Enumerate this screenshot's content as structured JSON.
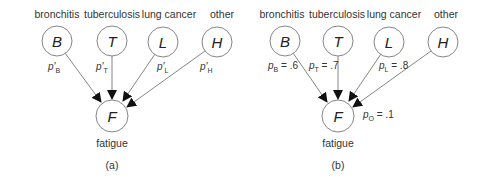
{
  "panels": [
    {
      "id": "a",
      "caption": "(a)",
      "nodes": [
        {
          "key": "B",
          "letter": "B",
          "label": "bronchitis",
          "cx": 57,
          "cy": 41
        },
        {
          "key": "T",
          "letter": "T",
          "label": "tuberculosis",
          "cx": 112,
          "cy": 41
        },
        {
          "key": "L",
          "letter": "L",
          "label": "lung cancer",
          "cx": 163,
          "cy": 42
        },
        {
          "key": "H",
          "letter": "H",
          "label": "other",
          "cx": 217,
          "cy": 42
        }
      ],
      "target": {
        "letter": "F",
        "label": "fatigue",
        "cx": 112,
        "cy": 116
      },
      "edge_labels": [
        {
          "sym": "p'",
          "sub": "B",
          "value": ""
        },
        {
          "sym": "p'",
          "sub": "T",
          "value": ""
        },
        {
          "sym": "p'",
          "sub": "L",
          "value": ""
        },
        {
          "sym": "p'",
          "sub": "H",
          "value": ""
        }
      ]
    },
    {
      "id": "b",
      "caption": "(b)",
      "nodes": [
        {
          "key": "B",
          "letter": "B",
          "label": "bronchitis",
          "cx": 285,
          "cy": 41
        },
        {
          "key": "T",
          "letter": "T",
          "label": "tuberculosis",
          "cx": 338,
          "cy": 41
        },
        {
          "key": "L",
          "letter": "L",
          "label": "lung cancer",
          "cx": 389,
          "cy": 42
        },
        {
          "key": "H",
          "letter": "H",
          "label": "other",
          "cx": 443,
          "cy": 42
        }
      ],
      "target": {
        "letter": "F",
        "label": "fatigue",
        "cx": 338,
        "cy": 116
      },
      "edge_labels": [
        {
          "sym": "p",
          "sub": "B",
          "value": " = .6"
        },
        {
          "sym": "p",
          "sub": "T",
          "value": " = .7"
        },
        {
          "sym": "p",
          "sub": "L",
          "value": " = .8"
        }
      ],
      "leak_label": {
        "sym": "p",
        "sub": "O",
        "value": " = .1"
      }
    }
  ]
}
